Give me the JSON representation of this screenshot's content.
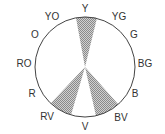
{
  "diagram": {
    "colors": {
      "stroke": "#444444",
      "hatch": "#9a9a9a",
      "text": "#333333"
    },
    "labels": [
      {
        "text": "Y",
        "x": 85,
        "y": 12
      },
      {
        "text": "YG",
        "x": 119,
        "y": 20
      },
      {
        "text": "G",
        "x": 134,
        "y": 38
      },
      {
        "text": "BG",
        "x": 145,
        "y": 67
      },
      {
        "text": "B",
        "x": 135,
        "y": 97
      },
      {
        "text": "BV",
        "x": 121,
        "y": 121
      },
      {
        "text": "V",
        "x": 85,
        "y": 130
      },
      {
        "text": "RV",
        "x": 47,
        "y": 120
      },
      {
        "text": "R",
        "x": 32,
        "y": 97
      },
      {
        "text": "RO",
        "x": 24,
        "y": 67
      },
      {
        "text": "O",
        "x": 35,
        "y": 38
      },
      {
        "text": "YO",
        "x": 52,
        "y": 20
      }
    ],
    "highlighted_segments": [
      "Y",
      "RV",
      "BV"
    ]
  }
}
